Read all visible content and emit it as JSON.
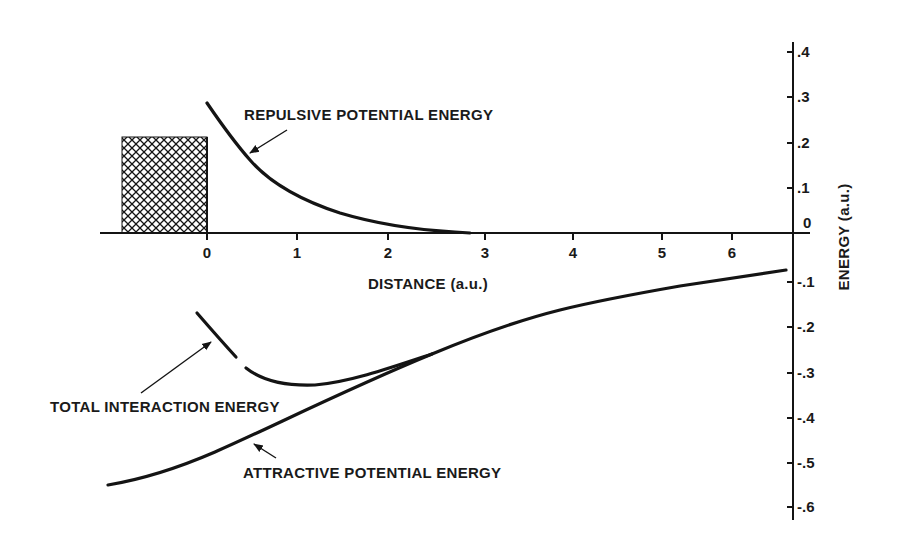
{
  "chart_data": {
    "type": "line",
    "title": "",
    "xlabel": "DISTANCE (a.u.)",
    "ylabel": "ENERGY (a.u.)",
    "x_ticks": [
      "0",
      "1",
      "2",
      "3",
      "4",
      "5",
      "6"
    ],
    "y_ticks": [
      ".4",
      ".3",
      ".2",
      ".1",
      "0",
      "-.1",
      "-.2",
      "-.3",
      "-.4",
      "-.5",
      "-.6"
    ],
    "xlim": [
      -1.2,
      6.5
    ],
    "ylim": [
      -0.6,
      0.4
    ],
    "grid": false,
    "legend": "none (curves labeled directly with arrows)",
    "shaded_region": {
      "label": "crosshatched (excluded) region",
      "x": [
        -0.95,
        0
      ],
      "y": [
        0,
        0.21
      ]
    },
    "series": [
      {
        "name": "REPULSIVE POTENTIAL ENERGY",
        "x": [
          0,
          0.25,
          0.5,
          0.75,
          1.0,
          1.5,
          2.0,
          2.5,
          3.0,
          4.0,
          5.0,
          6.0,
          6.5
        ],
        "y": [
          0.28,
          0.2,
          0.14,
          0.1,
          0.07,
          0.035,
          0.012,
          0.003,
          0.0,
          0.0,
          0.0,
          0.0,
          0.0
        ]
      },
      {
        "name": "TOTAL INTERACTION ENERGY",
        "x": [
          -0.1,
          0.15,
          0.35,
          0.5,
          0.75,
          1.0,
          1.5,
          2.0,
          2.5,
          3.0,
          4.0,
          5.0,
          6.0,
          6.5
        ],
        "y": [
          -0.17,
          -0.22,
          -0.27,
          -0.3,
          -0.32,
          -0.33,
          -0.31,
          -0.28,
          -0.25,
          -0.21,
          -0.16,
          -0.12,
          -0.095,
          -0.08
        ]
      },
      {
        "name": "ATTRACTIVE POTENTIAL ENERGY",
        "x": [
          -1.1,
          -0.5,
          0.0,
          0.5,
          1.0,
          1.5,
          2.0,
          2.5,
          3.0,
          4.0,
          5.0,
          6.0,
          6.5
        ],
        "y": [
          -0.55,
          -0.53,
          -0.49,
          -0.44,
          -0.39,
          -0.34,
          -0.29,
          -0.25,
          -0.21,
          -0.16,
          -0.12,
          -0.095,
          -0.08
        ]
      }
    ],
    "annotations": [
      {
        "text": "REPULSIVE POTENTIAL ENERGY",
        "points_to": "repulsive curve near x=0.45"
      },
      {
        "text": "TOTAL INTERACTION ENERGY",
        "points_to": "total curve near x=0.1"
      },
      {
        "text": "ATTRACTIVE POTENTIAL ENERGY",
        "points_to": "attractive curve near x=0.6"
      }
    ]
  },
  "labels": {
    "xlabel": "DISTANCE (a.u.)",
    "ylabel": "ENERGY (a.u.)",
    "repulsive": "REPULSIVE POTENTIAL ENERGY",
    "total": "TOTAL INTERACTION ENERGY",
    "attractive": "ATTRACTIVE POTENTIAL ENERGY"
  },
  "x_ticks": [
    {
      "label": "0",
      "px": 207
    },
    {
      "label": "1",
      "px": 297
    },
    {
      "label": "2",
      "px": 388
    },
    {
      "label": "3",
      "px": 485
    },
    {
      "label": "4",
      "px": 573
    },
    {
      "label": "5",
      "px": 662
    },
    {
      "label": "6",
      "px": 732
    }
  ],
  "y_ticks": [
    {
      "label": ".4",
      "py": 52
    },
    {
      "label": ".3",
      "py": 97
    },
    {
      "label": ".2",
      "py": 143
    },
    {
      "label": ".1",
      "py": 188
    },
    {
      "label": "0",
      "py": 233
    },
    {
      "label": "-.1",
      "py": 282
    },
    {
      "label": "-.2",
      "py": 327
    },
    {
      "label": "-.3",
      "py": 373
    },
    {
      "label": "-.4",
      "py": 418
    },
    {
      "label": "-.5",
      "py": 463
    },
    {
      "label": "-.6",
      "py": 507
    }
  ],
  "colors": {
    "ink": "#141414",
    "background": "#ffffff"
  }
}
